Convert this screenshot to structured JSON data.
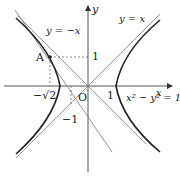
{
  "diagram": {
    "labels": {
      "y_axis": "y",
      "x_axis": "x",
      "origin": "O",
      "asymptote_pos": "y = x",
      "asymptote_neg": "y = −x",
      "point_a": "A",
      "tick_neg_sqrt2": "−√2",
      "tick_x_1": "1",
      "tick_y_1": "1",
      "tick_y_neg1": "−1",
      "curve_eq": "x² − y² = 1"
    },
    "colors": {
      "curve": "#222222",
      "line": "#555555",
      "axis": "#333333"
    }
  }
}
